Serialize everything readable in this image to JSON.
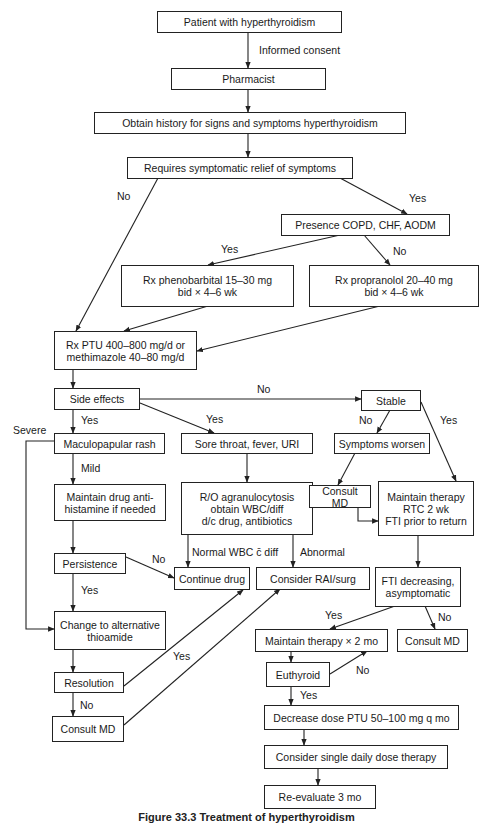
{
  "diagram": {
    "nodes": {
      "patient": "Patient with hyperthyroidism",
      "pharmacist": "Pharmacist",
      "history": "Obtain history for signs and symptoms hyperthyroidism",
      "relief": "Requires symptomatic relief of symptoms",
      "copd": "Presence COPD, CHF, AODM",
      "phenobarbital": "Rx phenobarbital 15–30 mg\nbid × 4–6 wk",
      "propranolol": "Rx propranolol 20–40 mg\nbid × 4–6 wk",
      "ptu": "Rx PTU 400–800 mg/d or\nmethimazole 40–80 mg/d",
      "side_effects": "Side effects",
      "stable": "Stable",
      "rash": "Maculopapular rash",
      "sore_throat": "Sore throat, fever, URI",
      "symptoms_worsen": "Symptoms worsen",
      "antihistamine": "Maintain drug anti-\nhistamine if needed",
      "agranulocytosis": "R/O agranulocytosis\nobtain WBC/diff\nd/c drug, antibiotics",
      "consult_md_1": "Consult MD",
      "maintain_rtc": "Maintain therapy\nRTC 2 wk\nFTI prior to return",
      "persistence": "Persistence",
      "continue_drug": "Continue drug",
      "rai_surg": "Consider RAI/surg",
      "fti_decreasing": "FTI decreasing,\nasymptomatic",
      "change_thioamide": "Change to alternative\nthioamide",
      "maintain_2mo": "Maintain therapy × 2 mo",
      "consult_md_2": "Consult MD",
      "resolution": "Resolution",
      "euthyroid": "Euthyroid",
      "consult_md_3": "Consult MD",
      "decrease_dose": "Decrease dose PTU 50–100 mg q mo",
      "single_dose": "Consider single daily dose therapy",
      "reevaluate": "Re-evaluate 3 mo"
    },
    "edge_labels": {
      "informed_consent": "Informed consent",
      "relief_no": "No",
      "relief_yes": "Yes",
      "copd_yes": "Yes",
      "copd_no": "No",
      "side_no": "No",
      "side_yes_rash": "Yes",
      "side_yes_throat": "Yes",
      "stable_no": "No",
      "stable_yes": "Yes",
      "severe": "Severe",
      "mild": "Mild",
      "persistence_no": "No",
      "persistence_yes": "Yes",
      "normal_wbc": "Normal WBC c̄ diff",
      "abnormal": "Abnormal",
      "fti_yes": "Yes",
      "fti_no": "No",
      "resolution_yes": "Yes",
      "resolution_no": "No",
      "euthyroid_no": "No",
      "euthyroid_yes": "Yes"
    },
    "caption": "Figure 33.3  Treatment of hyperthyroidism"
  }
}
